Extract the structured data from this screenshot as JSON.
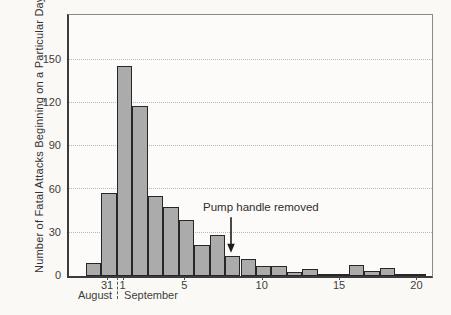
{
  "chart_data": {
    "type": "bar",
    "title": "",
    "xlabel": "",
    "ylabel": "Number of Fatal Attacks Beginning on a Particular Day",
    "categories": [
      "Aug 30",
      "Aug 31",
      "Sep 1",
      "Sep 2",
      "Sep 3",
      "Sep 4",
      "Sep 5",
      "Sep 6",
      "Sep 7",
      "Sep 8",
      "Sep 9",
      "Sep 10",
      "Sep 11",
      "Sep 12",
      "Sep 13",
      "Sep 14",
      "Sep 15",
      "Sep 16",
      "Sep 17",
      "Sep 18",
      "Sep 19",
      "Sep 20"
    ],
    "values": [
      8,
      57,
      145,
      117,
      55,
      47,
      38,
      21,
      28,
      13,
      11,
      6,
      6,
      2,
      4,
      1,
      1,
      7,
      3,
      5,
      1,
      1
    ],
    "ylim": [
      0,
      181
    ],
    "yticks": [
      0,
      30,
      60,
      90,
      120,
      150
    ],
    "xticks": [
      {
        "category_index": 1,
        "label": "31"
      },
      {
        "category_index": 2,
        "label": "1"
      },
      {
        "category_index": 6,
        "label": "5"
      },
      {
        "category_index": 11,
        "label": "10"
      },
      {
        "category_index": 16,
        "label": "15"
      },
      {
        "category_index": 21,
        "label": "20"
      }
    ],
    "months": [
      "August",
      "September"
    ],
    "month_separator_between": [
      "Aug 31",
      "Sep 1"
    ],
    "annotation": {
      "text": "Pump handle removed",
      "points_to_category": "Sep 8"
    },
    "grid": "horizontal dotted lines at y ticks, boxed plot frame",
    "legend": "none",
    "colors": {
      "bar_fill": "#ababab",
      "bar_border": "#272727",
      "grid": "#b9b9b4",
      "axis_text": "#3d3d3d",
      "annotation": "#1c1c1c",
      "background": "#faf9f6"
    }
  }
}
